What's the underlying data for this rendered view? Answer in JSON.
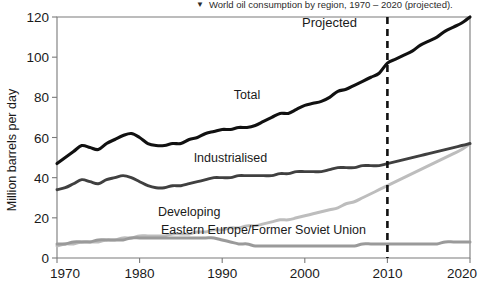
{
  "caption": {
    "marker_icon": "triangle-down-icon",
    "marker_glyph": "▼",
    "text": "World oil consumption by region, 1970 – 2020 (projected)."
  },
  "chart_data": {
    "type": "line",
    "title": "World oil consumption by region, 1970 – 2020 (projected).",
    "xlabel": "",
    "ylabel": "Million barrels per day",
    "xlim": [
      1970,
      2020
    ],
    "ylim": [
      0,
      120
    ],
    "grid": false,
    "legend_position": "inline-annotations",
    "xticks": [
      1970,
      1980,
      1990,
      2000,
      2010,
      2020
    ],
    "yticks": [
      0,
      20,
      40,
      60,
      80,
      100,
      120
    ],
    "xtick_labels": [
      "1970",
      "1980",
      "1990",
      "2000",
      "2010",
      "2020"
    ],
    "ytick_labels": [
      "0",
      "20",
      "40",
      "60",
      "80",
      "100",
      "120"
    ],
    "annotations": [
      {
        "name": "projected-label",
        "text": "Projected",
        "x": 2003,
        "y": 115
      },
      {
        "name": "projection-divider",
        "text": "",
        "x": 2010,
        "y": 0,
        "style": "dashed-vertical"
      }
    ],
    "x": [
      1970,
      1971,
      1972,
      1973,
      1974,
      1975,
      1976,
      1977,
      1978,
      1979,
      1980,
      1981,
      1982,
      1983,
      1984,
      1985,
      1986,
      1987,
      1988,
      1989,
      1990,
      1991,
      1992,
      1993,
      1994,
      1995,
      1996,
      1997,
      1998,
      1999,
      2000,
      2001,
      2002,
      2003,
      2004,
      2005,
      2006,
      2007,
      2008,
      2009,
      2010,
      2011,
      2012,
      2013,
      2014,
      2015,
      2016,
      2017,
      2018,
      2019,
      2020
    ],
    "series": [
      {
        "name": "Total",
        "color": "#111111",
        "label_x": 1993,
        "label_y": 79,
        "values": [
          47,
          50,
          53,
          56,
          55,
          54,
          57,
          59,
          61,
          62,
          60,
          57,
          56,
          56,
          57,
          57,
          59,
          60,
          62,
          63,
          64,
          64,
          65,
          65,
          66,
          68,
          70,
          72,
          72,
          74,
          76,
          77,
          78,
          80,
          83,
          84,
          86,
          88,
          90,
          92,
          97,
          99,
          101,
          103,
          106,
          108,
          110,
          113,
          115,
          117,
          120
        ]
      },
      {
        "name": "Industrialised",
        "color": "#404040",
        "label_x": 1991,
        "label_y": 48,
        "values": [
          34,
          35,
          37,
          39,
          38,
          37,
          39,
          40,
          41,
          40,
          38,
          36,
          35,
          35,
          36,
          36,
          37,
          38,
          39,
          40,
          40,
          40,
          41,
          41,
          41,
          41,
          41,
          42,
          42,
          43,
          43,
          43,
          43,
          44,
          45,
          45,
          45,
          46,
          46,
          46,
          47,
          48,
          49,
          50,
          51,
          52,
          53,
          54,
          55,
          56,
          57
        ]
      },
      {
        "name": "Developing",
        "color": "#bdbdbd",
        "label_x": 1986,
        "label_y": 21,
        "values": [
          6,
          7,
          7,
          8,
          8,
          8,
          9,
          9,
          10,
          10,
          11,
          11,
          11,
          11,
          12,
          12,
          12,
          13,
          13,
          14,
          14,
          15,
          15,
          16,
          16,
          17,
          18,
          19,
          19,
          20,
          21,
          22,
          23,
          24,
          25,
          27,
          28,
          30,
          32,
          34,
          36,
          38,
          40,
          42,
          44,
          46,
          48,
          50,
          52,
          54,
          57
        ]
      },
      {
        "name": "Eastern Europe/Former Soviet Union",
        "color": "#9a9a9a",
        "label_x": 1995,
        "label_y": 12,
        "values": [
          7,
          7,
          8,
          8,
          8,
          9,
          9,
          9,
          9,
          10,
          10,
          10,
          10,
          10,
          10,
          10,
          10,
          10,
          10,
          10,
          9,
          8,
          7,
          7,
          6,
          6,
          6,
          6,
          6,
          6,
          6,
          6,
          6,
          6,
          6,
          6,
          6,
          7,
          7,
          7,
          7,
          7,
          7,
          7,
          7,
          7,
          7,
          8,
          8,
          8,
          8
        ]
      }
    ]
  }
}
